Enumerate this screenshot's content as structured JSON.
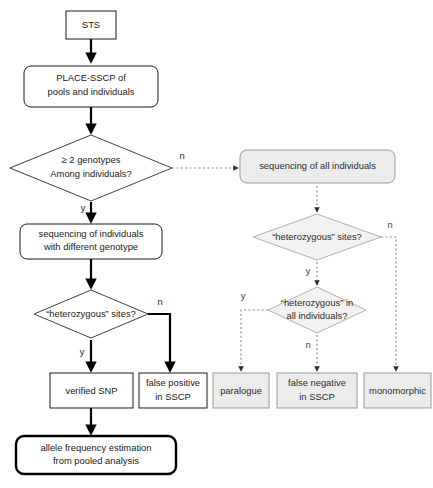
{
  "diagram": {
    "colors": {
      "solid_line": "#000000",
      "dashed_line": "#8c8c8c",
      "gray_fill": "#ececec",
      "white_fill": "#ffffff",
      "text": "#1a1a1a"
    },
    "nodes": {
      "sts": {
        "label": "STS",
        "shape": "rect",
        "style": "white"
      },
      "place_sscp": {
        "label_line1": "PLACE-SSCP of",
        "label_line2": "pools and individuals",
        "shape": "rounded-rect",
        "style": "white"
      },
      "genotypes_decision": {
        "label_line1": "≥ 2 genotypes",
        "label_line2": "Among individuals?",
        "shape": "diamond",
        "style": "white"
      },
      "seq_individuals": {
        "label_line1": "sequencing of individuals",
        "label_line2": "with different genotype",
        "shape": "rounded-rect",
        "style": "white"
      },
      "het_sites_left": {
        "label": "“heterozygous” sites?",
        "shape": "diamond",
        "style": "white"
      },
      "verified_snp": {
        "label": "verified SNP",
        "shape": "rect",
        "style": "white"
      },
      "false_positive": {
        "label_line1": "false positive",
        "label_line2": "in SSCP",
        "shape": "rect",
        "style": "white"
      },
      "allele_freq": {
        "label_line1": "allele frequency estimation",
        "label_line2": "from pooled analysis",
        "shape": "rounded-rect",
        "style": "thick"
      },
      "seq_all": {
        "label": "sequencing of all individuals",
        "shape": "rounded-rect",
        "style": "gray"
      },
      "het_sites_right": {
        "label": "“heterozygous” sites?",
        "shape": "diamond",
        "style": "gray"
      },
      "het_all": {
        "label_line1": "“heterozygous” in",
        "label_line2": "all individuals?",
        "shape": "diamond",
        "style": "gray"
      },
      "paralogue": {
        "label": "paralogue",
        "shape": "rect",
        "style": "gray"
      },
      "false_negative": {
        "label_line1": "false negative",
        "label_line2": "in SSCP",
        "shape": "rect",
        "style": "gray"
      },
      "monomorphic": {
        "label": "monomorphic",
        "shape": "rect",
        "style": "gray"
      }
    },
    "edge_labels": {
      "genotypes_n": "n",
      "genotypes_y": "y",
      "het_left_n": "n",
      "het_left_y": "y",
      "het_right_n": "n",
      "het_right_y": "y",
      "het_all_y": "y",
      "het_all_n": "n"
    }
  }
}
